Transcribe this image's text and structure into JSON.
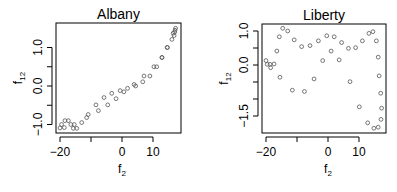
{
  "chart_data": [
    {
      "type": "scatter",
      "title": "Albany",
      "xlabel": "f",
      "xlabel_sub": "2",
      "ylabel": "f",
      "ylabel_sub": "12",
      "xlim": [
        -21.5,
        18.5
      ],
      "ylim": [
        -1.2,
        1.6
      ],
      "xticks": [
        -20,
        -10,
        0,
        10
      ],
      "xtick_labels": [
        "-20",
        "",
        "0",
        "10"
      ],
      "yticks": [
        -1.0,
        -0.5,
        0.0,
        0.5,
        1.0
      ],
      "ytick_labels": [
        "-1.0",
        "",
        "0.0",
        "",
        "1.0"
      ],
      "grid": false,
      "marker": "open-circle",
      "marker_color": "#555555",
      "box": {
        "x0": 56,
        "y0": 23,
        "x1": 181,
        "y1": 133,
        "px_x0": 122,
        "px_per_x": 3.1,
        "px_y0": 86,
        "px_per_y": 38.5
      },
      "points": [
        [
          -20,
          -1.09
        ],
        [
          -19.5,
          -1.0
        ],
        [
          -18.6,
          -1.08
        ],
        [
          -18.4,
          -0.9
        ],
        [
          -17.3,
          -0.9
        ],
        [
          -16.5,
          -1.0
        ],
        [
          -15.7,
          -1.1
        ],
        [
          -15.4,
          -1.0
        ],
        [
          -14.6,
          -1.1
        ],
        [
          -13.0,
          -0.95
        ],
        [
          -11.4,
          -0.82
        ],
        [
          -10.9,
          -0.74
        ],
        [
          -8.4,
          -0.49
        ],
        [
          -7.6,
          -0.64
        ],
        [
          -5.8,
          -0.3
        ],
        [
          -4.6,
          -0.49
        ],
        [
          -3.3,
          -0.19
        ],
        [
          -1.9,
          -0.33
        ],
        [
          -0.6,
          -0.12
        ],
        [
          0.6,
          -0.15
        ],
        [
          1.8,
          -0.06
        ],
        [
          3.9,
          0.04
        ],
        [
          4.4,
          0.0
        ],
        [
          6.7,
          0.11
        ],
        [
          7.1,
          0.26
        ],
        [
          9.0,
          0.26
        ],
        [
          10.3,
          0.5
        ],
        [
          11.2,
          0.5
        ],
        [
          12.9,
          0.74
        ],
        [
          12.9,
          0.74
        ],
        [
          14.6,
          1.0
        ],
        [
          14.6,
          1.0
        ],
        [
          16.1,
          1.21
        ],
        [
          16.5,
          1.37
        ],
        [
          17.1,
          1.45
        ],
        [
          17.3,
          1.5
        ],
        [
          17.0,
          1.4
        ],
        [
          16.8,
          1.31
        ]
      ]
    },
    {
      "type": "scatter",
      "title": "Liberty",
      "xlabel": "f",
      "xlabel_sub": "2",
      "ylabel": "f",
      "ylabel_sub": "12",
      "xlim": [
        -21.5,
        18.5
      ],
      "ylim": [
        -2.0,
        1.2
      ],
      "xticks": [
        -20,
        -10,
        0,
        10
      ],
      "xtick_labels": [
        "-20",
        "",
        "0",
        "10"
      ],
      "yticks": [
        -1.5,
        -1.0,
        -0.5,
        0.0,
        0.5,
        1.0
      ],
      "ytick_labels": [
        "-1.5",
        "",
        "",
        "0.0",
        "",
        "1.0"
      ],
      "grid": false,
      "marker": "open-circle",
      "marker_color": "#555555",
      "box": {
        "x0": 262,
        "y0": 24,
        "x1": 386,
        "y1": 133,
        "px_x0": 328,
        "px_per_x": 3.1,
        "px_y0": 65,
        "px_per_y": 34
      },
      "points": [
        [
          -20,
          0.13
        ],
        [
          -19.6,
          0.02
        ],
        [
          -18.7,
          0.02
        ],
        [
          -18.5,
          -0.08
        ],
        [
          -17.4,
          0.03
        ],
        [
          -16.5,
          0.41
        ],
        [
          -15.7,
          0.83
        ],
        [
          -15.5,
          -0.36
        ],
        [
          -14.6,
          1.08
        ],
        [
          -13.0,
          1.0
        ],
        [
          -11.5,
          -0.74
        ],
        [
          -10.9,
          0.74
        ],
        [
          -8.5,
          0.54
        ],
        [
          -7.6,
          -0.78
        ],
        [
          -5.8,
          0.57
        ],
        [
          -4.5,
          -0.41
        ],
        [
          -3.1,
          0.71
        ],
        [
          -1.7,
          0.13
        ],
        [
          -0.4,
          0.86
        ],
        [
          1.0,
          0.41
        ],
        [
          2.0,
          0.83
        ],
        [
          3.6,
          0.15
        ],
        [
          4.4,
          0.66
        ],
        [
          6.6,
          0.49
        ],
        [
          7.1,
          -0.49
        ],
        [
          8.9,
          0.51
        ],
        [
          10.1,
          -1.23
        ],
        [
          11.1,
          0.71
        ],
        [
          12.8,
          -1.7
        ],
        [
          13.2,
          0.93
        ],
        [
          14.5,
          0.98
        ],
        [
          14.8,
          -1.86
        ],
        [
          15.6,
          0.71
        ],
        [
          16.2,
          -1.83
        ],
        [
          16.2,
          0.23
        ],
        [
          16.5,
          -0.32
        ],
        [
          17.0,
          -0.83
        ],
        [
          17.1,
          -1.6
        ],
        [
          17.3,
          -1.27
        ]
      ]
    }
  ]
}
